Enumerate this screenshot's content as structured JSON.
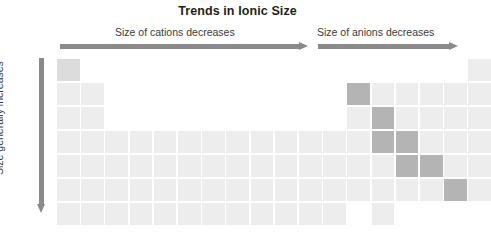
{
  "figure": {
    "title": "Trends in Ionic Size",
    "type": "periodic-table-trend-diagram",
    "width": 475,
    "height": 235,
    "background": "#ffffff"
  },
  "annotations": {
    "cations_caption": "Size of cations decreases",
    "anions_caption": "Size of anions decreases",
    "vertical_caption": "Size generally increases",
    "arrow_color": "#8a8a8a",
    "cations_arrow_direction": "right",
    "anions_arrow_direction": "right",
    "vertical_arrow_direction": "down"
  },
  "colors": {
    "cell_light": "#ededed",
    "cell_mid": "#dcdcdc",
    "cell_dark": "#b4b4b4",
    "title_text": "#231f20",
    "caption_text": "#3b3b3b"
  },
  "grid": {
    "columns": 18,
    "rows": 7,
    "cell_width": 22.6,
    "cell_height": 22.4,
    "gap": 1.6,
    "note": "Main-group periodic table outline; transition block present rows 4-7. Highlighted (darker) cells form the metalloid staircase.",
    "cells": [
      {
        "row": 1,
        "col": 1,
        "shade": "mid"
      },
      {
        "row": 1,
        "col": 18,
        "shade": "light"
      },
      {
        "row": 2,
        "col": 1,
        "shade": "light"
      },
      {
        "row": 2,
        "col": 2,
        "shade": "light"
      },
      {
        "row": 2,
        "col": 13,
        "shade": "dark"
      },
      {
        "row": 2,
        "col": 14,
        "shade": "light"
      },
      {
        "row": 2,
        "col": 15,
        "shade": "light"
      },
      {
        "row": 2,
        "col": 16,
        "shade": "light"
      },
      {
        "row": 2,
        "col": 17,
        "shade": "light"
      },
      {
        "row": 2,
        "col": 18,
        "shade": "light"
      },
      {
        "row": 3,
        "col": 1,
        "shade": "light"
      },
      {
        "row": 3,
        "col": 2,
        "shade": "light"
      },
      {
        "row": 3,
        "col": 13,
        "shade": "light"
      },
      {
        "row": 3,
        "col": 14,
        "shade": "dark"
      },
      {
        "row": 3,
        "col": 15,
        "shade": "light"
      },
      {
        "row": 3,
        "col": 16,
        "shade": "light"
      },
      {
        "row": 3,
        "col": 17,
        "shade": "light"
      },
      {
        "row": 3,
        "col": 18,
        "shade": "light"
      },
      {
        "row": 4,
        "col": 1,
        "shade": "light"
      },
      {
        "row": 4,
        "col": 2,
        "shade": "light"
      },
      {
        "row": 4,
        "col": 3,
        "shade": "light"
      },
      {
        "row": 4,
        "col": 4,
        "shade": "light"
      },
      {
        "row": 4,
        "col": 5,
        "shade": "light"
      },
      {
        "row": 4,
        "col": 6,
        "shade": "light"
      },
      {
        "row": 4,
        "col": 7,
        "shade": "light"
      },
      {
        "row": 4,
        "col": 8,
        "shade": "light"
      },
      {
        "row": 4,
        "col": 9,
        "shade": "light"
      },
      {
        "row": 4,
        "col": 10,
        "shade": "light"
      },
      {
        "row": 4,
        "col": 11,
        "shade": "light"
      },
      {
        "row": 4,
        "col": 12,
        "shade": "light"
      },
      {
        "row": 4,
        "col": 13,
        "shade": "light"
      },
      {
        "row": 4,
        "col": 14,
        "shade": "dark"
      },
      {
        "row": 4,
        "col": 15,
        "shade": "dark"
      },
      {
        "row": 4,
        "col": 16,
        "shade": "light"
      },
      {
        "row": 4,
        "col": 17,
        "shade": "light"
      },
      {
        "row": 4,
        "col": 18,
        "shade": "light"
      },
      {
        "row": 5,
        "col": 1,
        "shade": "light"
      },
      {
        "row": 5,
        "col": 2,
        "shade": "light"
      },
      {
        "row": 5,
        "col": 3,
        "shade": "light"
      },
      {
        "row": 5,
        "col": 4,
        "shade": "light"
      },
      {
        "row": 5,
        "col": 5,
        "shade": "light"
      },
      {
        "row": 5,
        "col": 6,
        "shade": "light"
      },
      {
        "row": 5,
        "col": 7,
        "shade": "light"
      },
      {
        "row": 5,
        "col": 8,
        "shade": "light"
      },
      {
        "row": 5,
        "col": 9,
        "shade": "light"
      },
      {
        "row": 5,
        "col": 10,
        "shade": "light"
      },
      {
        "row": 5,
        "col": 11,
        "shade": "light"
      },
      {
        "row": 5,
        "col": 12,
        "shade": "light"
      },
      {
        "row": 5,
        "col": 13,
        "shade": "light"
      },
      {
        "row": 5,
        "col": 14,
        "shade": "light"
      },
      {
        "row": 5,
        "col": 15,
        "shade": "dark"
      },
      {
        "row": 5,
        "col": 16,
        "shade": "dark"
      },
      {
        "row": 5,
        "col": 17,
        "shade": "light"
      },
      {
        "row": 5,
        "col": 18,
        "shade": "light"
      },
      {
        "row": 6,
        "col": 1,
        "shade": "light"
      },
      {
        "row": 6,
        "col": 2,
        "shade": "light"
      },
      {
        "row": 6,
        "col": 3,
        "shade": "light"
      },
      {
        "row": 6,
        "col": 4,
        "shade": "light"
      },
      {
        "row": 6,
        "col": 5,
        "shade": "light"
      },
      {
        "row": 6,
        "col": 6,
        "shade": "light"
      },
      {
        "row": 6,
        "col": 7,
        "shade": "light"
      },
      {
        "row": 6,
        "col": 8,
        "shade": "light"
      },
      {
        "row": 6,
        "col": 9,
        "shade": "light"
      },
      {
        "row": 6,
        "col": 10,
        "shade": "light"
      },
      {
        "row": 6,
        "col": 11,
        "shade": "light"
      },
      {
        "row": 6,
        "col": 12,
        "shade": "light"
      },
      {
        "row": 6,
        "col": 13,
        "shade": "light"
      },
      {
        "row": 6,
        "col": 14,
        "shade": "light"
      },
      {
        "row": 6,
        "col": 15,
        "shade": "light"
      },
      {
        "row": 6,
        "col": 16,
        "shade": "light"
      },
      {
        "row": 6,
        "col": 17,
        "shade": "dark"
      },
      {
        "row": 6,
        "col": 18,
        "shade": "light"
      },
      {
        "row": 7,
        "col": 1,
        "shade": "light"
      },
      {
        "row": 7,
        "col": 2,
        "shade": "light"
      },
      {
        "row": 7,
        "col": 3,
        "shade": "light"
      },
      {
        "row": 7,
        "col": 4,
        "shade": "light"
      },
      {
        "row": 7,
        "col": 5,
        "shade": "light"
      },
      {
        "row": 7,
        "col": 6,
        "shade": "light"
      },
      {
        "row": 7,
        "col": 7,
        "shade": "light"
      },
      {
        "row": 7,
        "col": 8,
        "shade": "light"
      },
      {
        "row": 7,
        "col": 9,
        "shade": "light"
      },
      {
        "row": 7,
        "col": 10,
        "shade": "light"
      },
      {
        "row": 7,
        "col": 11,
        "shade": "light"
      },
      {
        "row": 7,
        "col": 12,
        "shade": "light"
      },
      {
        "row": 7,
        "col": 14,
        "shade": "light"
      }
    ]
  }
}
